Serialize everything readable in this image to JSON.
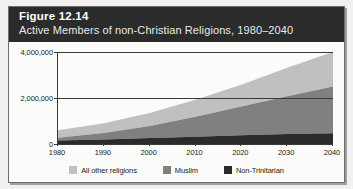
{
  "figure": {
    "number_label": "Figure 12.14",
    "caption": "Active Members of non-Christian Religions, 1980–2040"
  },
  "colors": {
    "banner_bg": "#2b2b2b",
    "banner_text": "#ffffff",
    "frame_border": "#6e6e6e",
    "page_bg": "#f2f1ef",
    "series_all_other": "#c0c0c0",
    "series_muslim": "#808080",
    "series_non_trinitarian": "#2b2b2b",
    "axis": "#3a3a3a"
  },
  "legend": {
    "position": "bottom-center",
    "items": [
      {
        "label": "All other religions",
        "color": "#c0c0c0",
        "swatch_name": "legend-swatch-all-other-religions"
      },
      {
        "label": "Muslim",
        "color": "#808080",
        "swatch_name": "legend-swatch-muslim"
      },
      {
        "label": "Non-Trinitarian",
        "color": "#2b2b2b",
        "swatch_name": "legend-swatch-non-trinitarian"
      }
    ]
  },
  "chart_data": {
    "type": "area",
    "stacked": true,
    "title": "Active Members of non-Christian Religions, 1980–2040",
    "subtitle": "Figure 12.14",
    "xlabel": "",
    "ylabel": "",
    "x": [
      1980,
      1990,
      2000,
      2010,
      2020,
      2030,
      2040
    ],
    "xlim": [
      1980,
      2040
    ],
    "ylim": [
      0,
      4000000
    ],
    "yticks": [
      0,
      2000000,
      4000000
    ],
    "ytick_labels": [
      "0",
      "2,000,000",
      "4,000,000"
    ],
    "xtick_labels": [
      "1980",
      "1990",
      "2000",
      "2010",
      "2020",
      "2030",
      "2040"
    ],
    "grid": false,
    "gridlines_horizontal": [
      2000000,
      4000000
    ],
    "legend_position": "bottom-center",
    "series": [
      {
        "name": "Non-Trinitarian",
        "color": "#2b2b2b",
        "values": [
          150000,
          200000,
          260000,
          320000,
          380000,
          430000,
          470000
        ]
      },
      {
        "name": "Muslim",
        "color": "#808080",
        "values": [
          120000,
          280000,
          520000,
          860000,
          1250000,
          1650000,
          2030000
        ]
      },
      {
        "name": "All other religions",
        "color": "#c0c0c0",
        "values": [
          330000,
          420000,
          570000,
          740000,
          950000,
          1230000,
          1500000
        ]
      }
    ],
    "stack_totals": [
      600000,
      900000,
      1350000,
      1920000,
      2580000,
      3310000,
      4000000
    ]
  }
}
